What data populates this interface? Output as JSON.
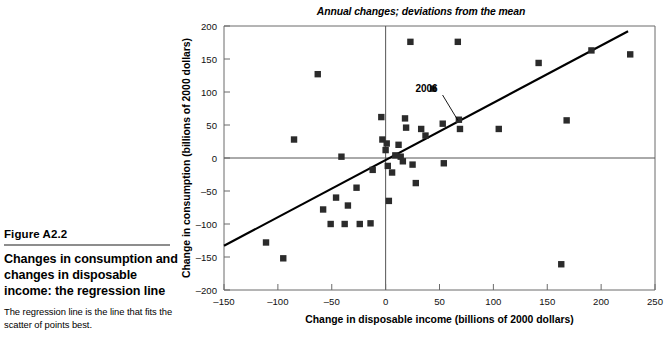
{
  "figure": {
    "number": "Figure A2.2",
    "title": "Changes in consumption and changes in disposable income: the regression line",
    "subtitle": "The regression line is the line that fits the scatter of points best."
  },
  "chart_data": {
    "type": "scatter",
    "title": "Annual changes; deviations from the mean",
    "xlabel": "Change in disposable income (billions of 2000 dollars)",
    "ylabel": "Change in consumption (billions of 2000 dollars)",
    "xlim": [
      -150,
      250
    ],
    "ylim": [
      -200,
      200
    ],
    "xticks": [
      -150,
      -100,
      -50,
      0,
      50,
      100,
      150,
      200,
      250
    ],
    "yticks": [
      -200,
      -150,
      -100,
      -50,
      0,
      50,
      100,
      150,
      200
    ],
    "grid": false,
    "legend": "none",
    "marker_color": "#2b2b2b",
    "line_color": "#000000",
    "points": [
      {
        "x": -111,
        "y": -128
      },
      {
        "x": -95,
        "y": -152
      },
      {
        "x": -85,
        "y": 28
      },
      {
        "x": -63,
        "y": 127
      },
      {
        "x": -58,
        "y": -78
      },
      {
        "x": -51,
        "y": -100
      },
      {
        "x": -46,
        "y": -60
      },
      {
        "x": -41,
        "y": 2
      },
      {
        "x": -38,
        "y": -100
      },
      {
        "x": -35,
        "y": -72
      },
      {
        "x": -27,
        "y": -45
      },
      {
        "x": -24,
        "y": -100
      },
      {
        "x": -14,
        "y": -99
      },
      {
        "x": -12,
        "y": -18
      },
      {
        "x": -4,
        "y": 62
      },
      {
        "x": -3,
        "y": 28
      },
      {
        "x": 0,
        "y": 12
      },
      {
        "x": 1,
        "y": 22
      },
      {
        "x": 2,
        "y": -12
      },
      {
        "x": 3,
        "y": -65
      },
      {
        "x": 6,
        "y": -22
      },
      {
        "x": 9,
        "y": 4
      },
      {
        "x": 12,
        "y": 20
      },
      {
        "x": 14,
        "y": 2
      },
      {
        "x": 16,
        "y": -5
      },
      {
        "x": 18,
        "y": 60
      },
      {
        "x": 19,
        "y": 46
      },
      {
        "x": 23,
        "y": 176
      },
      {
        "x": 25,
        "y": -10
      },
      {
        "x": 28,
        "y": -38
      },
      {
        "x": 33,
        "y": 44
      },
      {
        "x": 37,
        "y": 34
      },
      {
        "x": 44,
        "y": 105
      },
      {
        "x": 53,
        "y": 52
      },
      {
        "x": 54,
        "y": -8
      },
      {
        "x": 67,
        "y": 176
      },
      {
        "x": 68,
        "y": 58
      },
      {
        "x": 69,
        "y": 44
      },
      {
        "x": 105,
        "y": 44
      },
      {
        "x": 142,
        "y": 144
      },
      {
        "x": 163,
        "y": -161
      },
      {
        "x": 168,
        "y": 57
      },
      {
        "x": 191,
        "y": 163
      },
      {
        "x": 227,
        "y": 157
      }
    ],
    "annotation": {
      "label": "2006",
      "label_x": 38,
      "label_y": 100,
      "point_x": 68,
      "point_y": 54
    },
    "regression_line": {
      "x1": -150,
      "y1": -133,
      "x2": 225,
      "y2": 192
    }
  }
}
